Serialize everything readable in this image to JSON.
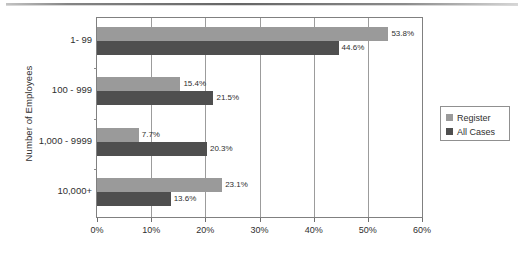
{
  "chart_data": {
    "type": "bar",
    "orientation": "horizontal",
    "title": "",
    "xlabel": "",
    "ylabel": "Number of Employees",
    "categories": [
      "1- 99",
      "100 - 999",
      "1,000 - 9999",
      "10,000+"
    ],
    "series": [
      {
        "name": "Register",
        "color": "#9a9a9a",
        "values": [
          53.8,
          15.4,
          7.7,
          23.1
        ],
        "value_labels": [
          "53.8%",
          "15.4%",
          "7.7%",
          "23.1%"
        ]
      },
      {
        "name": "All Cases",
        "color": "#4f4f4f",
        "values": [
          44.6,
          21.5,
          20.3,
          13.6
        ],
        "value_labels": [
          "44.6%",
          "21.5%",
          "20.3%",
          "13.6%"
        ]
      }
    ],
    "xlim": [
      0,
      60
    ],
    "xticks": [
      0,
      10,
      20,
      30,
      40,
      50,
      60
    ],
    "xtick_labels": [
      "0%",
      "10%",
      "20%",
      "30%",
      "40%",
      "50%",
      "60%"
    ],
    "grid": "vertical",
    "legend_position": "right"
  },
  "legend": {
    "entries": [
      {
        "label": "Register",
        "color": "#9a9a9a"
      },
      {
        "label": "All Cases",
        "color": "#4f4f4f"
      }
    ]
  }
}
